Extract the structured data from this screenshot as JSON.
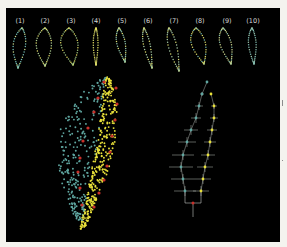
{
  "figure": {
    "background": "#000000",
    "page_background": "#f4f3ee",
    "colors": {
      "teal": "#5fa6a0",
      "yellow": "#e8e03a",
      "red": "#c8302a",
      "cross": "#cfd3cf",
      "label": "#d8d8d8"
    }
  },
  "outlines": {
    "labels": [
      "(1)",
      "(2)",
      "(3)",
      "(4)",
      "(5)",
      "(6)",
      "(7)",
      "(8)",
      "(9)",
      "(10)"
    ],
    "items": [
      {
        "label": "(1)",
        "cx": 20,
        "top": 28,
        "w": 13,
        "h": 40,
        "lean": -2,
        "color": "#6fb7b0",
        "tint": "#c9d98a"
      },
      {
        "label": "(2)",
        "cx": 45,
        "top": 28,
        "w": 16,
        "h": 38,
        "lean": 0,
        "color": "#a9c98e",
        "tint": "#e1dd6a"
      },
      {
        "label": "(3)",
        "cx": 71,
        "top": 28,
        "w": 18,
        "h": 37,
        "lean": 2,
        "color": "#9bc07e",
        "tint": "#e3d85c"
      },
      {
        "label": "(4)",
        "cx": 96,
        "top": 28,
        "w": 5,
        "h": 37,
        "lean": 0,
        "color": "#d9dc70",
        "tint": "#e7e05a"
      },
      {
        "label": "(5)",
        "cx": 122,
        "top": 28,
        "w": 9,
        "h": 34,
        "lean": 3,
        "color": "#8dbfa8",
        "tint": "#d8dc74"
      },
      {
        "label": "(6)",
        "cx": 148,
        "top": 28,
        "w": 7,
        "h": 40,
        "lean": 4,
        "color": "#a4c9a2",
        "tint": "#dedb6a"
      },
      {
        "label": "(7)",
        "cx": 174,
        "top": 28,
        "w": 9,
        "h": 43,
        "lean": 5,
        "color": "#a4c7a4",
        "tint": "#d7d66d"
      },
      {
        "label": "(8)",
        "cx": 200,
        "top": 28,
        "w": 15,
        "h": 36,
        "lean": 4,
        "color": "#d4d364",
        "tint": "#6fb2ad"
      },
      {
        "label": "(9)",
        "cx": 227,
        "top": 28,
        "w": 12,
        "h": 36,
        "lean": 4,
        "color": "#c6d18a",
        "tint": "#88bca8"
      },
      {
        "label": "(10)",
        "cx": 253,
        "top": 28,
        "w": 8,
        "h": 36,
        "lean": 1,
        "color": "#7fb8ae",
        "tint": "#9fc7ad"
      }
    ]
  },
  "point_cloud": {
    "tip": [
      108,
      78
    ],
    "base": [
      82,
      232
    ],
    "left_extent": 40,
    "right_extent": 15,
    "teal_points": 260,
    "yellow_points": 330,
    "red_points": [
      [
        104,
        82
      ],
      [
        98,
        98
      ],
      [
        94,
        112
      ],
      [
        88,
        128
      ],
      [
        83,
        141
      ],
      [
        80,
        158
      ],
      [
        78,
        172
      ],
      [
        80,
        188
      ],
      [
        82,
        205
      ],
      [
        116,
        88
      ],
      [
        117,
        104
      ],
      [
        115,
        120
      ],
      [
        112,
        136
      ],
      [
        110,
        152
      ],
      [
        107,
        166
      ],
      [
        104,
        180
      ],
      [
        99,
        193
      ],
      [
        94,
        207
      ]
    ]
  },
  "tree": {
    "trunk_x": 193,
    "trunk_bottom": 217,
    "split_y": 203,
    "root": [
      193,
      203
    ],
    "left_nodes": [
      {
        "x": 207,
        "y": 82,
        "half": 0
      },
      {
        "x": 202,
        "y": 94,
        "half": 2
      },
      {
        "x": 199,
        "y": 106,
        "half": 4
      },
      {
        "x": 196,
        "y": 118,
        "half": 5
      },
      {
        "x": 191,
        "y": 130,
        "half": 7
      },
      {
        "x": 187,
        "y": 142,
        "half": 9
      },
      {
        "x": 183,
        "y": 155,
        "half": 11
      },
      {
        "x": 181,
        "y": 167,
        "half": 12
      },
      {
        "x": 183,
        "y": 179,
        "half": 12
      },
      {
        "x": 185,
        "y": 191,
        "half": 11
      }
    ],
    "right_nodes": [
      {
        "x": 211,
        "y": 94,
        "half": 0
      },
      {
        "x": 214,
        "y": 106,
        "half": 3
      },
      {
        "x": 214,
        "y": 118,
        "half": 4
      },
      {
        "x": 212,
        "y": 130,
        "half": 5
      },
      {
        "x": 210,
        "y": 142,
        "half": 6
      },
      {
        "x": 208,
        "y": 155,
        "half": 7
      },
      {
        "x": 205,
        "y": 167,
        "half": 8
      },
      {
        "x": 203,
        "y": 179,
        "half": 8
      },
      {
        "x": 201,
        "y": 191,
        "half": 8
      }
    ]
  },
  "margin_ticks": [
    {
      "y": 100,
      "h": 6
    },
    {
      "y": 160,
      "h": 1
    }
  ]
}
